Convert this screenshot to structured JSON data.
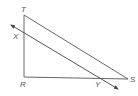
{
  "diagram": {
    "type": "geometry-triangle",
    "labels": {
      "T": "T",
      "X": "X",
      "R": "R",
      "Y": "Y",
      "S": "S"
    },
    "colors": {
      "line": "#666666",
      "label": "#555555",
      "background": "#ffffff"
    },
    "segments": [
      {
        "name": "TR",
        "from": "T",
        "to": "R"
      },
      {
        "name": "RS",
        "from": "R",
        "to": "S"
      },
      {
        "name": "TS",
        "from": "T",
        "to": "S"
      },
      {
        "name": "XY",
        "type": "line-with-arrows",
        "parallel_to": "TS"
      }
    ]
  }
}
